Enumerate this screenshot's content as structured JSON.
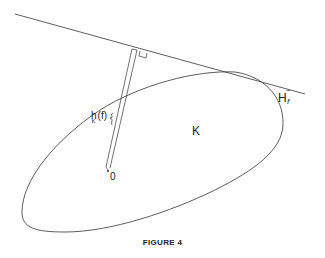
{
  "figure": {
    "caption": "FIGURE 4",
    "labels": {
      "body": "K",
      "origin": "0",
      "support_function_main": "h",
      "support_function_sub": "K",
      "support_function_arg": "(f)",
      "hyperplane_main": "H",
      "hyperplane_tilde": "~",
      "hyperplane_sub": "f"
    },
    "elements": [
      "supporting-hyperplane-line",
      "convex-body-K",
      "support-distance-segment",
      "right-angle-marker",
      "origin-point"
    ],
    "colors": {
      "stroke": "#333333",
      "background": "#ffffff",
      "text": "#222222"
    }
  }
}
